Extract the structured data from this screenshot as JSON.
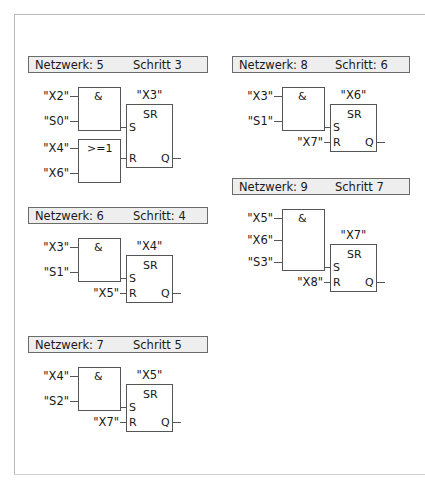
{
  "networks": [
    {
      "id": "nw5",
      "name": "Netzwerk: 5",
      "step": "Schritt 3",
      "and_gate": {
        "op": "&",
        "inputs": [
          "\"X2\"",
          "\"S0\""
        ]
      },
      "or_gate": {
        "op": ">=1",
        "inputs": [
          "\"X4\"",
          "\"X6\""
        ]
      },
      "sr": {
        "type": "SR",
        "output_label": "\"X3\"",
        "set_pin": "S",
        "reset_pin": "R",
        "q_pin": "Q",
        "reset_source": ""
      }
    },
    {
      "id": "nw6",
      "name": "Netzwerk: 6",
      "step": "Schritt: 4",
      "and_gate": {
        "op": "&",
        "inputs": [
          "\"X3\"",
          "\"S1\""
        ]
      },
      "sr": {
        "type": "SR",
        "output_label": "\"X4\"",
        "set_pin": "S",
        "reset_pin": "R",
        "q_pin": "Q",
        "reset_source": "\"X5\""
      }
    },
    {
      "id": "nw7",
      "name": "Netzwerk: 7",
      "step": "Schritt 5",
      "and_gate": {
        "op": "&",
        "inputs": [
          "\"X4\"",
          "\"S2\""
        ]
      },
      "sr": {
        "type": "SR",
        "output_label": "\"X5\"",
        "set_pin": "S",
        "reset_pin": "R",
        "q_pin": "Q",
        "reset_source": "\"X7\""
      }
    },
    {
      "id": "nw8",
      "name": "Netzwerk: 8",
      "step": "Schritt: 6",
      "and_gate": {
        "op": "&",
        "inputs": [
          "\"X3\"",
          "\"S1\""
        ]
      },
      "sr": {
        "type": "SR",
        "output_label": "\"X6\"",
        "set_pin": "S",
        "reset_pin": "R",
        "q_pin": "Q",
        "reset_source": "\"X7\""
      }
    },
    {
      "id": "nw9",
      "name": "Netzwerk: 9",
      "step": "Schritt 7",
      "and_gate": {
        "op": "&",
        "inputs": [
          "\"X5\"",
          "\"X6\"",
          "\"S3\""
        ]
      },
      "sr": {
        "type": "SR",
        "output_label": "\"X7\"",
        "set_pin": "S",
        "reset_pin": "R",
        "q_pin": "Q",
        "reset_source": "\"X8\""
      }
    }
  ],
  "colors": {
    "line": "#555555",
    "header_bg": "#eeeeee",
    "header_border": "#6b6b6b",
    "text": "#1a1a1a",
    "page_frame": "#b9b9b9"
  }
}
